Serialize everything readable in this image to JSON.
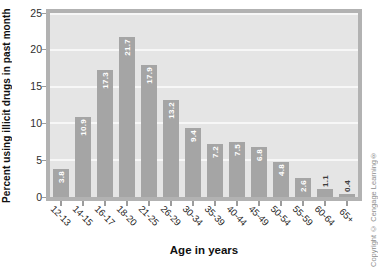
{
  "chart_data": {
    "type": "bar",
    "title": "",
    "categories": [
      "12-13",
      "14-15",
      "16-17",
      "18-20",
      "21-25",
      "26-29",
      "30-34",
      "35-39",
      "40-44",
      "45-49",
      "50-54",
      "55-59",
      "60-64",
      "65+"
    ],
    "values": [
      3.8,
      10.9,
      17.3,
      21.7,
      17.9,
      13.2,
      9.4,
      7.2,
      7.5,
      6.8,
      4.8,
      2.6,
      1.1,
      0.4
    ],
    "xlabel": "Age in years",
    "ylabel": "Percent using illicit drugs in past month",
    "ylim": [
      0,
      25
    ],
    "yticks": [
      0,
      5,
      10,
      15,
      20,
      25
    ],
    "grid": "horizontal",
    "legend": "none",
    "value_label_style": "rotated 90deg CCW, white inside tall bars, dark gray above short bars",
    "colors": {
      "bar": "#a5a5a5",
      "plot_background": "#e5e5e5",
      "frame": "#b2b2b2",
      "gridline": "#f7f7f7",
      "value_label_inside": "#ffffff",
      "value_label_outside": "#3c3c3c",
      "axis_text": "#2e2e2e",
      "title_text": "#101010"
    }
  },
  "copyright_notice": "Copyright © Cengage Learning®"
}
